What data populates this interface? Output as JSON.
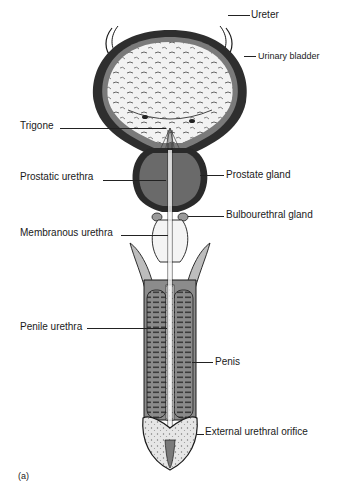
{
  "figure": {
    "panel_label": "(a)"
  },
  "labels": {
    "ureter": "Ureter",
    "urinary_bladder": "Urinary bladder",
    "trigone": "Trigone",
    "prostatic_urethra": "Prostatic urethra",
    "prostate_gland": "Prostate gland",
    "bulbourethral_gland": "Bulbourethral gland",
    "membranous_urethra": "Membranous urethra",
    "penile_urethra": "Penile urethra",
    "penis": "Penis",
    "external_urethral_orifice": "External urethral orifice"
  },
  "colors": {
    "outline": "#1a1a1a",
    "tissue_dark": "#6e6e6e",
    "tissue_mid": "#a8a8a8",
    "tissue_light": "#d4d4d4",
    "background": "#ffffff"
  }
}
